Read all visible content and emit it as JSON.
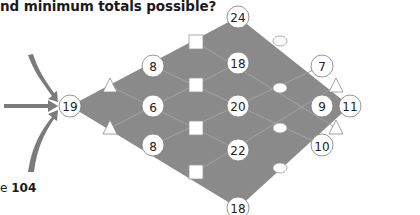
{
  "question": {
    "text": "nd minimum totals possible?"
  },
  "page_reference": {
    "prefix": "e",
    "number": "104"
  },
  "colors": {
    "diamond_fill": "#8a8a8a",
    "grid_line": "#9d9d9d",
    "node_fill": "#ffffff",
    "node_stroke": "#7a7a7a",
    "arrow": "#7b7b7b"
  },
  "diagram": {
    "start_node": {
      "label": "19"
    },
    "end_node": {
      "label": "11"
    },
    "column1": [
      {
        "label": "8"
      },
      {
        "label": "6"
      },
      {
        "label": "8"
      }
    ],
    "column2": [
      {
        "label": "24"
      },
      {
        "label": "18"
      },
      {
        "label": "20"
      },
      {
        "label": "22"
      },
      {
        "label": "18"
      }
    ],
    "column3": [
      {
        "label": "7"
      },
      {
        "label": "9"
      },
      {
        "label": "10"
      }
    ],
    "operators": {
      "triangles": [
        "triangle-op",
        "triangle-op",
        "triangle-op",
        "triangle-op"
      ],
      "squares": [
        "square-op",
        "square-op",
        "square-op",
        "square-op"
      ],
      "ovals": [
        "oval-op",
        "oval-op",
        "oval-op",
        "oval-op"
      ]
    },
    "entry_arrows": 3
  }
}
